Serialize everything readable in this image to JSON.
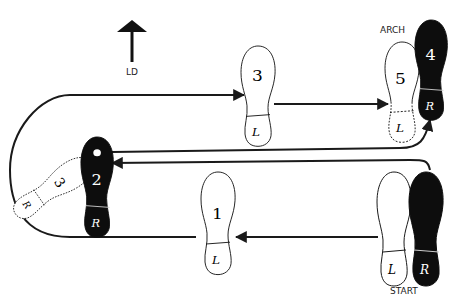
{
  "direction": {
    "label": "LD",
    "icon": "arrow-up-icon"
  },
  "labels": {
    "arch": "ARCH",
    "start": "START"
  },
  "colors": {
    "ink": "#1a1a1a",
    "shoe_black": "#0d0d0d",
    "background": "#ffffff"
  },
  "feet": [
    {
      "id": "start-left",
      "number": "",
      "heel": "L",
      "style": "open"
    },
    {
      "id": "start-right",
      "number": "",
      "heel": "R",
      "style": "black"
    },
    {
      "id": "step-1",
      "number": "1",
      "heel": "L",
      "style": "open"
    },
    {
      "id": "step-2",
      "number": "2",
      "heel": "R",
      "style": "black"
    },
    {
      "id": "step-3-ghost",
      "number": "3",
      "heel": "R",
      "style": "dashed"
    },
    {
      "id": "step-3",
      "number": "3",
      "heel": "L",
      "style": "open"
    },
    {
      "id": "step-4",
      "number": "4",
      "heel": "R",
      "style": "black"
    },
    {
      "id": "step-5",
      "number": "5",
      "heel": "L",
      "style": "dashed-open"
    }
  ]
}
